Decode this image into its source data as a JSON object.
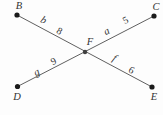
{
  "figure": {
    "points": [
      {
        "id": "B",
        "label": "B"
      },
      {
        "id": "C",
        "label": "C"
      },
      {
        "id": "D",
        "label": "D"
      },
      {
        "id": "E",
        "label": "E"
      },
      {
        "id": "F",
        "label": "F"
      }
    ],
    "segments": [
      {
        "from": "F",
        "to": "B",
        "variable": "b",
        "value": "8"
      },
      {
        "from": "F",
        "to": "C",
        "variable": "a",
        "value": "5"
      },
      {
        "from": "F",
        "to": "D",
        "variable": "g",
        "value": "9"
      },
      {
        "from": "F",
        "to": "E",
        "variable": "f",
        "value": "6"
      }
    ],
    "colors": {
      "background": "#fdfdfd",
      "line": "#606060",
      "point": "#1b1b1b",
      "point_f": "#404040",
      "label": "#333333"
    }
  }
}
